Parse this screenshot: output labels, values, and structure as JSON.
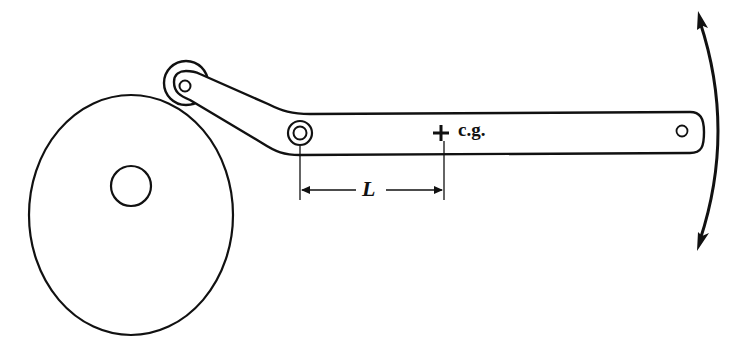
{
  "diagram": {
    "type": "mechanical-linkage",
    "colors": {
      "stroke": "#111111",
      "background": "#ffffff"
    },
    "labels": {
      "center_of_gravity": "c.g.",
      "distance": "L"
    },
    "components": [
      {
        "id": "disc",
        "name": "Eccentric disc / cam"
      },
      {
        "id": "disc-hub",
        "name": "Disc shaft hole"
      },
      {
        "id": "roller",
        "name": "Roller follower"
      },
      {
        "id": "pivot",
        "name": "Arm pivot"
      },
      {
        "id": "arm",
        "name": "Lever arm"
      },
      {
        "id": "end-hole",
        "name": "Arm end hole"
      },
      {
        "id": "cg-marker",
        "name": "Center of gravity marker"
      },
      {
        "id": "dimension-L",
        "name": "Distance L from pivot to c.g."
      },
      {
        "id": "motion-arrow",
        "name": "Oscillation double-headed arc arrow"
      }
    ]
  }
}
